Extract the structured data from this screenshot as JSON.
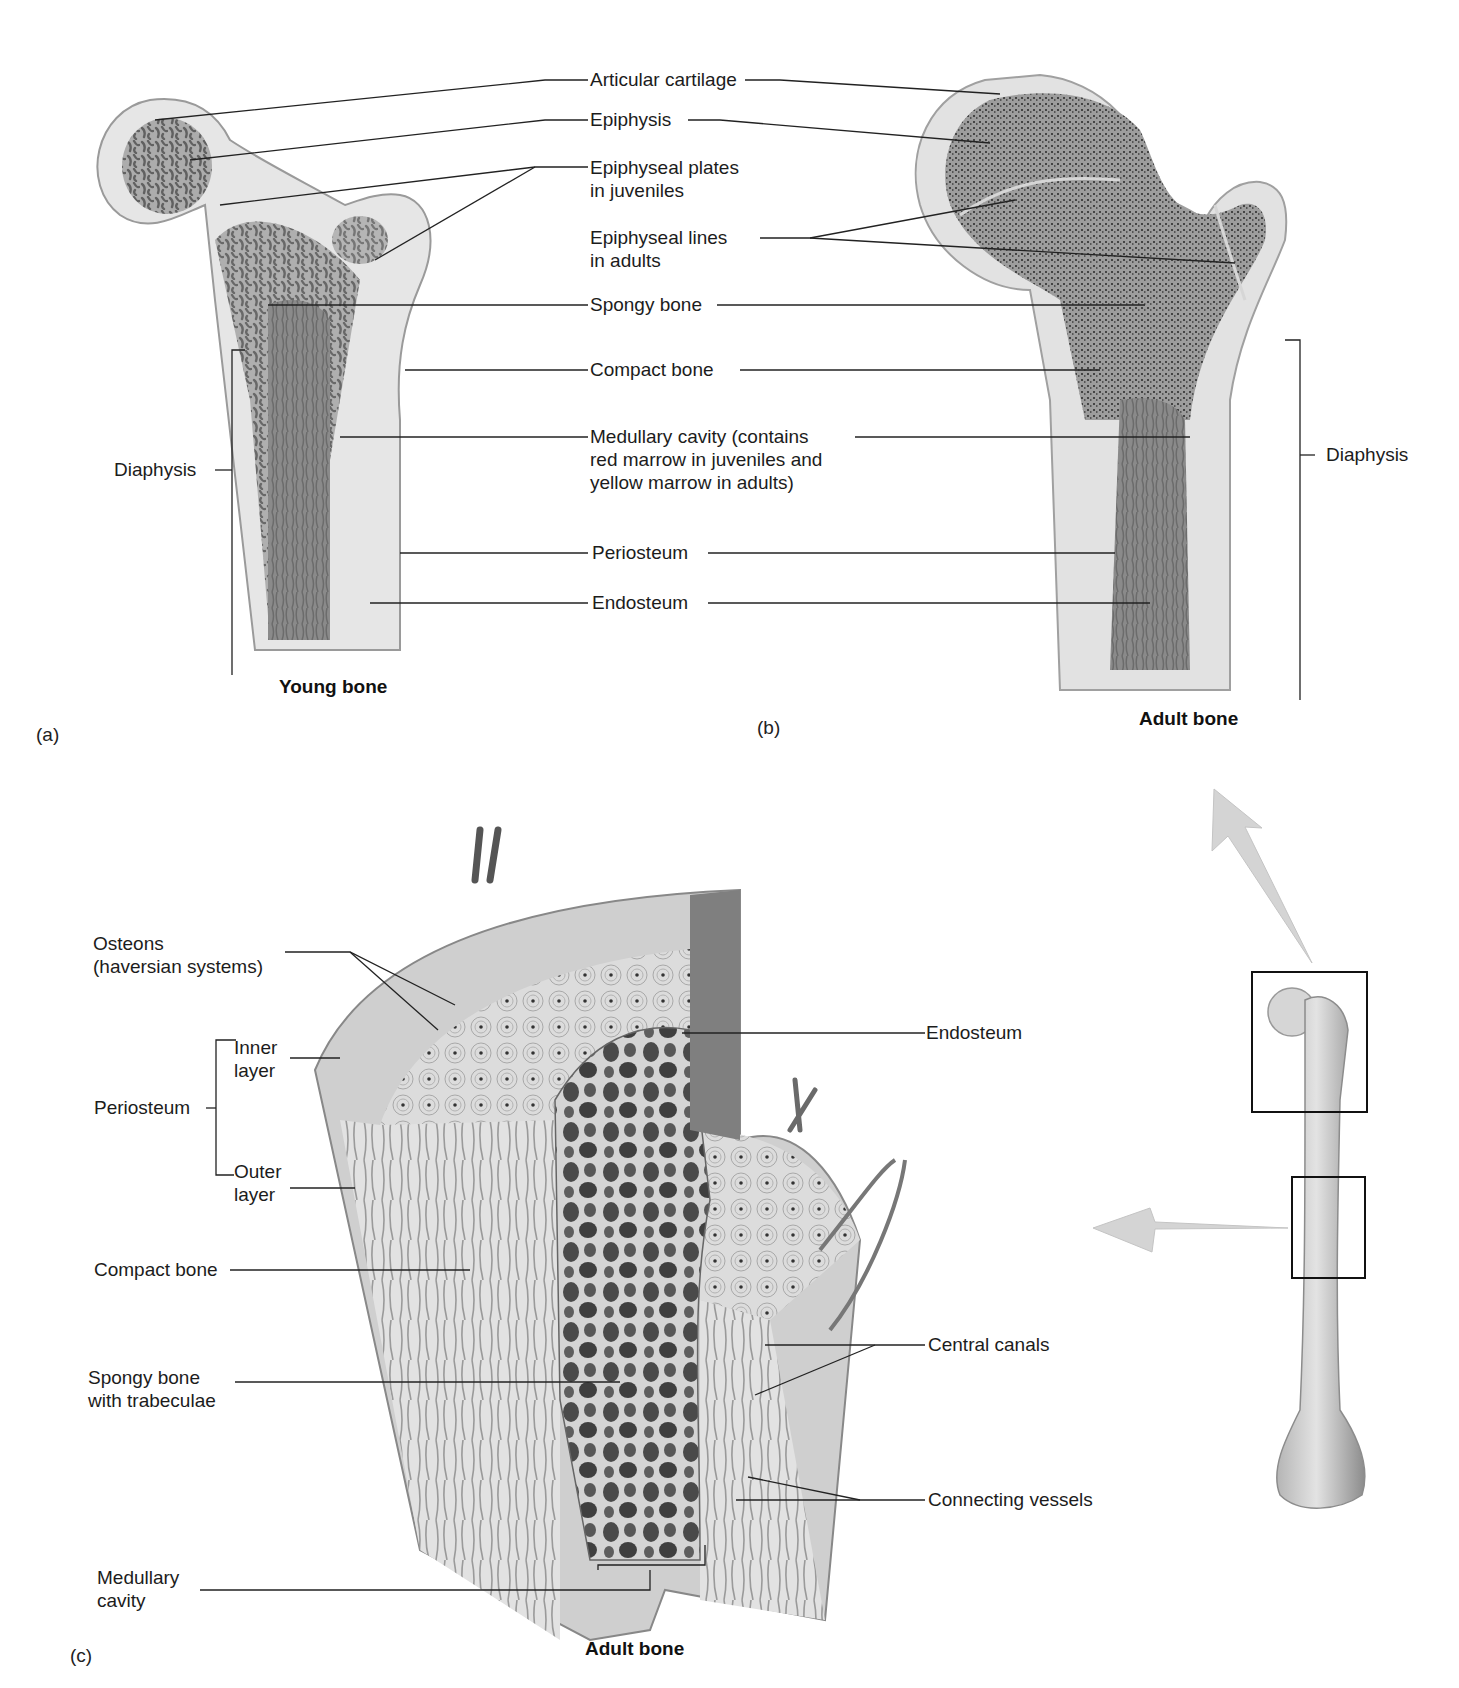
{
  "figure": {
    "panels": {
      "a": {
        "letter": "(a)",
        "caption": "Young bone"
      },
      "b": {
        "letter": "(b)",
        "caption": "Adult bone"
      },
      "c": {
        "letter": "(c)",
        "caption": "Adult bone"
      }
    },
    "top_labels": {
      "articular_cartilage": "Articular cartilage",
      "epiphysis": "Epiphysis",
      "epiphyseal_plates": "Epiphyseal plates\nin juveniles",
      "epiphyseal_lines": "Epiphyseal lines\nin adults",
      "spongy_bone": "Spongy bone",
      "compact_bone": "Compact bone",
      "medullary_cavity": "Medullary cavity (contains\nred marrow in juveniles and\nyellow marrow in adults)",
      "periosteum": "Periosteum",
      "endosteum": "Endosteum",
      "diaphysis_left": "Diaphysis",
      "diaphysis_right": "Diaphysis"
    },
    "bottom_labels": {
      "osteons": "Osteons\n(haversian systems)",
      "inner_layer": "Inner\nlayer",
      "periosteum": "Periosteum",
      "outer_layer": "Outer\nlayer",
      "compact_bone": "Compact bone",
      "spongy_bone": "Spongy bone\nwith trabeculae",
      "medullary_cavity": "Medullary\ncavity",
      "endosteum": "Endosteum",
      "central_canals": "Central canals",
      "connecting_vessels": "Connecting vessels"
    },
    "colors": {
      "ink": "#1c1c1c",
      "bone_light": "#e4e4e4",
      "bone_mid": "#bdbdbd",
      "marrow_dark": "#6e6e6e",
      "arrow": "#d2d2d2",
      "line": "#222222"
    }
  }
}
